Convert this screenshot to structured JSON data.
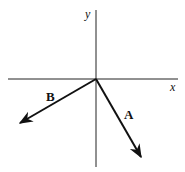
{
  "diagram": {
    "type": "vector-diagram",
    "axes": {
      "x_label": "x",
      "y_label": "y"
    },
    "vectors": [
      {
        "label": "A",
        "direction": "down-right (4th quadrant)"
      },
      {
        "label": "B",
        "direction": "down-left (3rd quadrant)"
      }
    ],
    "colors": {
      "line": "#111111",
      "background": "#ffffff"
    }
  }
}
